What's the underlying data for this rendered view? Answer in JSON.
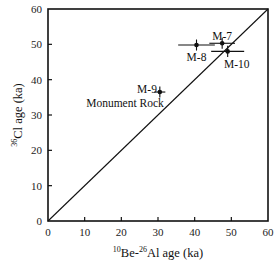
{
  "chart_data": {
    "type": "scatter",
    "title": "",
    "xlabel": "10Be-26Al age (ka)",
    "ylabel": "36Cl age (ka)",
    "xlabel_parts": {
      "sup1": "10",
      "t1": "Be-",
      "sup2": "26",
      "t2": "Al  age (ka)"
    },
    "ylabel_parts": {
      "sup": "36",
      "t": "Cl age (ka)"
    },
    "xlim": [
      0,
      60
    ],
    "ylim": [
      0,
      60
    ],
    "xticks": [
      0,
      10,
      20,
      30,
      40,
      50,
      60
    ],
    "yticks": [
      0,
      10,
      20,
      30,
      40,
      50,
      60
    ],
    "grid": false,
    "reference_line": {
      "label": "1:1 line",
      "from": [
        0,
        0
      ],
      "to": [
        60,
        60
      ]
    },
    "points": [
      {
        "name": "M-7",
        "x": 47.5,
        "y": 50.3,
        "xerr": 3.5,
        "yerr": 1.0
      },
      {
        "name": "M-8",
        "x": 40.5,
        "y": 49.8,
        "xerr": 5.0,
        "yerr": 1.0
      },
      {
        "name": "M-10",
        "x": 49.0,
        "y": 48.0,
        "xerr": 4.5,
        "yerr": 1.0
      },
      {
        "name": "M-9",
        "x": 30.5,
        "y": 36.5,
        "xerr": 1.5,
        "yerr": 1.0
      }
    ],
    "annotations": [
      {
        "text": "M-7",
        "x": 47.5,
        "y": 52.5
      },
      {
        "text": "M-8",
        "x": 40.5,
        "y": 46.5
      },
      {
        "text": "M-10",
        "x": 51.5,
        "y": 44.5
      },
      {
        "text": "M-9",
        "x": 27.0,
        "y": 37.5
      },
      {
        "text": "Monument Rock",
        "x": 21.0,
        "y": 33.5
      }
    ]
  }
}
